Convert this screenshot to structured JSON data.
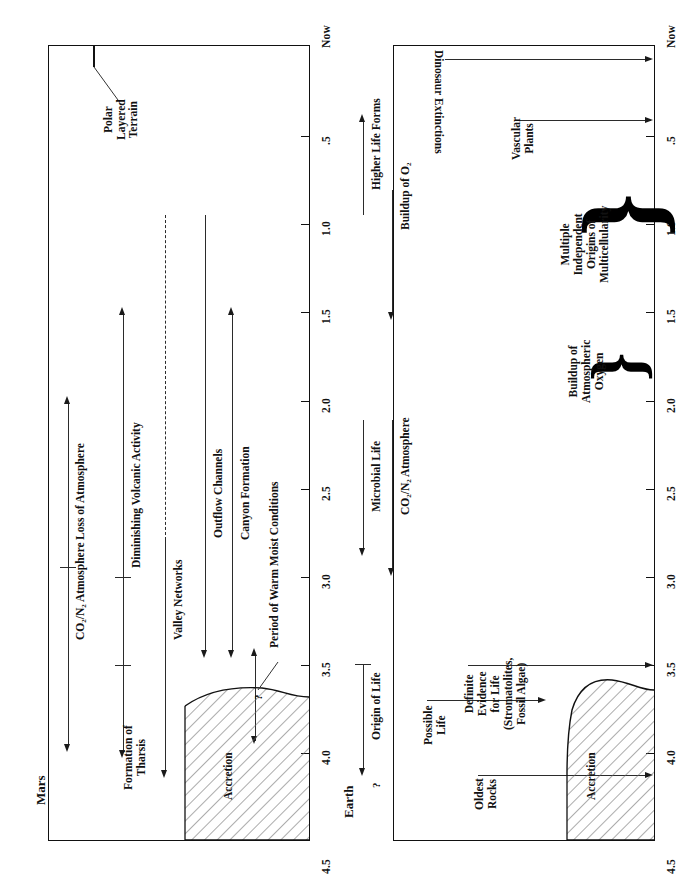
{
  "figure": {
    "type": "comparative-timeline",
    "orientation": "rotated-90",
    "axis": {
      "label_unit": "billions of years before present",
      "ticks": [
        "Now",
        ".5",
        "1.0",
        "1.5",
        "2.0",
        "2.5",
        "3.0",
        "3.5",
        "4.0",
        "4.5"
      ],
      "tick_values": [
        0,
        0.5,
        1.0,
        1.5,
        2.0,
        2.5,
        3.0,
        3.5,
        4.0,
        4.5
      ],
      "range": [
        0,
        4.5
      ]
    }
  },
  "mars": {
    "title": "Mars",
    "events": [
      {
        "id": "co2n2",
        "label": "CO₂/N₂ Atmosphere",
        "start": 4.2,
        "end": 2.0
      },
      {
        "id": "loss_atm",
        "label": "Loss of Atmosphere",
        "start": 3.6,
        "end": 1.5
      },
      {
        "id": "formation",
        "label": "Formation of\nTharsis",
        "start": 4.1,
        "end": 3.45
      },
      {
        "id": "volcanic",
        "label": "Diminishing Volcanic Activity",
        "start": 3.6,
        "end": 1.5
      },
      {
        "id": "valley",
        "label": "Valley Networks",
        "start": 4.0,
        "end": 2.55
      },
      {
        "id": "outflow",
        "label": "Outflow Channels",
        "start": 3.5,
        "end": 1.0
      },
      {
        "id": "canyon",
        "label": "Canyon Formation",
        "start": 3.5,
        "end": 1.5
      },
      {
        "id": "warm_moist",
        "label": "Period of Warm Moist Conditions",
        "start": 4.0,
        "end": 3.6
      },
      {
        "id": "question",
        "label": "?",
        "start": 3.95,
        "end": 3.55
      },
      {
        "id": "polar",
        "label": "Polar\nLayered\nTerrain",
        "start": 0.1,
        "end": 0.1
      },
      {
        "id": "accretion",
        "label": "Accretion",
        "start": 4.5,
        "end": 3.8
      }
    ]
  },
  "earth": {
    "title": "Earth",
    "events": [
      {
        "id": "origin_life",
        "label": "Origin of Life",
        "start": 4.3,
        "end": 3.5
      },
      {
        "id": "qmark",
        "label": "?",
        "start": 4.3,
        "end": 4.3
      },
      {
        "id": "microbial",
        "label": "Microbial Life",
        "start": 3.5,
        "end": 2.7
      },
      {
        "id": "co2n2e",
        "label": "CO₂/N₂ Atmosphere",
        "start": 3.5,
        "end": 2.5
      },
      {
        "id": "buildup_o2",
        "label": "Buildup of O₂",
        "start": 2.4,
        "end": 1.4
      },
      {
        "id": "higher_life",
        "label": "Higher Life Forms",
        "start": 1.2,
        "end": 0.05
      },
      {
        "id": "oldest",
        "label": "Oldest\nRocks",
        "start": 4.15,
        "end": 4.15
      },
      {
        "id": "possible",
        "label": "Possible\nLife",
        "start": 3.85,
        "end": 3.85
      },
      {
        "id": "definite",
        "label": "Definite\nEvidence\nfor Life\n(Stromatolites,\nFossil Algae)",
        "start": 3.5,
        "end": 3.5
      },
      {
        "id": "accretion_e",
        "label": "Accretion",
        "start": 4.5,
        "end": 4.15
      },
      {
        "id": "brace_oxy",
        "label": "Buildup of\nAtmospheric\nOxygen",
        "start": 2.0,
        "end": 1.5
      },
      {
        "id": "brace_multi",
        "label": "Multiple\nIndependent\nOrigins of\nMulticellularity",
        "start": 1.3,
        "end": 0.55
      },
      {
        "id": "vascular",
        "label": "Vascular\nPlants",
        "start": 0.42,
        "end": 0.42
      },
      {
        "id": "dinosaur",
        "label": "Dinosaur Extinctions",
        "start": 0.065,
        "end": 0.065
      }
    ]
  },
  "colors": {
    "ink": "#111111",
    "line": "#2b2b2b",
    "hatch": "#555555"
  }
}
